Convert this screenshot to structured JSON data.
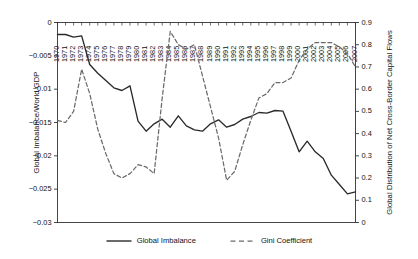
{
  "chart_data": {
    "type": "line",
    "title": "",
    "xlabel": "",
    "ylabel": "Global Imbalance/World GDP",
    "y2label": "Global Distribution of Net Cross-Border Capital Flows",
    "grid": false,
    "legend_position": "bottom-center",
    "xlim": [
      1970,
      2007
    ],
    "ylim": [
      -0.03,
      0
    ],
    "y2lim": [
      0,
      0.9
    ],
    "x": [
      1970,
      1971,
      1972,
      1973,
      1974,
      1975,
      1976,
      1977,
      1978,
      1979,
      1980,
      1981,
      1982,
      1983,
      1984,
      1985,
      1986,
      1987,
      1988,
      1989,
      1990,
      1991,
      1992,
      1993,
      1994,
      1995,
      1996,
      1997,
      1998,
      1999,
      2000,
      2001,
      2002,
      2003,
      2004,
      2005,
      2006,
      2007
    ],
    "xtick_labels": [
      "1970",
      "1971",
      "1972",
      "1973",
      "1974",
      "1975",
      "1976",
      "1977",
      "1978",
      "1979",
      "1980",
      "1981",
      "1982",
      "1983",
      "1984",
      "1985",
      "1986",
      "1987",
      "1988",
      "1989",
      "1990",
      "1991",
      "1992",
      "1993",
      "1994",
      "1995",
      "1996",
      "1997",
      "1998",
      "1999",
      "2000",
      "2001",
      "2002",
      "2003",
      "2004",
      "2005",
      "2006",
      "2007"
    ],
    "ytick_labels_left": [
      "0",
      "-0.005",
      "-0.01",
      "-0.015",
      "-0.02",
      "-0.025",
      "-0.03"
    ],
    "ytick_values_left": [
      0,
      -0.005,
      -0.01,
      -0.015,
      -0.02,
      -0.025,
      -0.03
    ],
    "ytick_labels_right": [
      "0.9",
      "0.8",
      "0.7",
      "0.6",
      "0.5",
      "0.4",
      "0.3",
      "0.2",
      "0.1",
      "0"
    ],
    "ytick_values_right": [
      0.9,
      0.8,
      0.7,
      0.6,
      0.5,
      0.4,
      0.3,
      0.2,
      0.1,
      0
    ],
    "series": [
      {
        "name": "Global Imbalance",
        "axis": "left",
        "style": "solid",
        "color": "#2a2a2a",
        "values": [
          -0.0018,
          -0.0018,
          -0.0022,
          -0.002,
          -0.0063,
          -0.0076,
          -0.0087,
          -0.0098,
          -0.0102,
          -0.0095,
          -0.0148,
          -0.0163,
          -0.0152,
          -0.0145,
          -0.0157,
          -0.014,
          -0.0155,
          -0.0161,
          -0.0163,
          -0.0152,
          -0.0146,
          -0.0157,
          -0.0153,
          -0.0145,
          -0.0141,
          -0.0135,
          -0.0136,
          -0.0132,
          -0.0133,
          -0.0163,
          -0.0194,
          -0.0178,
          -0.0194,
          -0.0204,
          -0.0229,
          -0.0243,
          -0.0257,
          -0.0254
        ]
      },
      {
        "name": "Gini Coefficient",
        "axis": "right",
        "style": "dashed",
        "color": "#6b6b6b",
        "values": [
          0.46,
          0.45,
          0.5,
          0.69,
          0.58,
          0.42,
          0.31,
          0.22,
          0.2,
          0.22,
          0.26,
          0.25,
          0.22,
          0.56,
          0.86,
          0.8,
          0.78,
          0.8,
          0.66,
          0.52,
          0.38,
          0.19,
          0.23,
          0.35,
          0.46,
          0.56,
          0.58,
          0.63,
          0.63,
          0.65,
          0.73,
          0.78,
          0.81,
          0.81,
          0.81,
          0.79,
          0.76,
          0.7
        ]
      }
    ]
  },
  "legend": {
    "items": [
      {
        "label": "Global Imbalance",
        "style": "solid",
        "color": "#2a2a2a"
      },
      {
        "label": "Gini Coefficient",
        "style": "dashed",
        "color": "#6b6b6b"
      }
    ]
  }
}
